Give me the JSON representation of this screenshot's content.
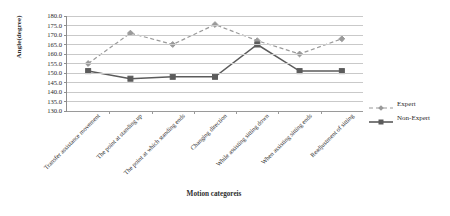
{
  "chart_data": {
    "type": "line",
    "title": "",
    "xlabel": "Motion categoreis",
    "ylabel": "Angle(degree)",
    "ylim": [
      130.0,
      180.0
    ],
    "ytick_step": 5.0,
    "grid": true,
    "legend_position": "right",
    "categories": [
      "Transfer assistance movement",
      "The point at standing up",
      "The point at which standing ends",
      "Changing direction",
      "While assisting sitting down",
      "When assisting sitting ends",
      "Readjustment of sitting"
    ],
    "ytick_labels": [
      "180.0",
      "175.0",
      "170.0",
      "165.0",
      "160.0",
      "155.0",
      "150.0",
      "145.0",
      "140.0",
      "135.0",
      "130.0"
    ],
    "ytick_values": [
      180.0,
      175.0,
      170.0,
      165.0,
      160.0,
      155.0,
      150.0,
      145.0,
      140.0,
      135.0,
      130.0
    ],
    "series": [
      {
        "name": "Expert",
        "values": [
          155.0,
          171.0,
          165.0,
          175.5,
          167.0,
          160.0,
          168.0
        ],
        "color": "#9a9a9a",
        "line_style": "dashed",
        "marker": "diamond"
      },
      {
        "name": "Non-Expert",
        "values": [
          151.0,
          147.0,
          148.0,
          148.0,
          165.0,
          151.0,
          151.0
        ],
        "color": "#5b5b5b",
        "line_style": "solid",
        "marker": "square"
      }
    ]
  },
  "legend": {
    "items": [
      {
        "label": "Expert"
      },
      {
        "label": "Non-Expert"
      }
    ]
  }
}
